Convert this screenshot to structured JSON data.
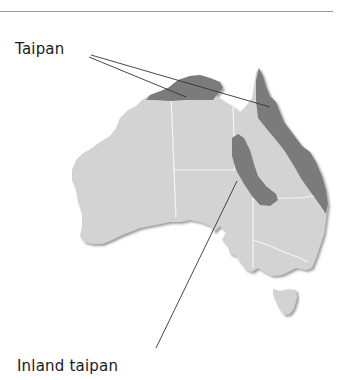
{
  "map": {
    "region": "Australia",
    "colors": {
      "land": "#d3d3d3",
      "land_shadow": "#9e9e9e",
      "state_border": "#f4f4f4",
      "range": "#7b7b7b",
      "leader_line": "#333333",
      "rule": "#9a9a9a"
    },
    "labels": {
      "taipan": "Taipan",
      "inland_taipan": "Inland taipan"
    },
    "legend_items": [
      {
        "species": "Taipan",
        "range_areas": [
          "Northern Australia (Top End coast)",
          "Eastern Queensland coast"
        ]
      },
      {
        "species": "Inland taipan",
        "range_areas": [
          "Central-east interior (SW Queensland / NE South Australia)"
        ]
      }
    ]
  }
}
